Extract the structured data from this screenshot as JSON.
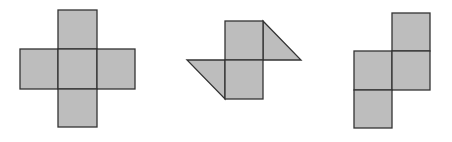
{
  "figure": {
    "colors": {
      "fill": "#bdbdbd",
      "stroke": "#333333",
      "background": "#ffffff"
    },
    "shapes": [
      {
        "name": "cross-net",
        "cells": 6
      },
      {
        "name": "squares-with-triangles",
        "cells": 2,
        "triangles": 2
      },
      {
        "name": "stair-net",
        "cells": 4
      }
    ]
  }
}
